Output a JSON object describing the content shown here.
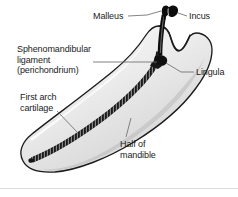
{
  "figure": {
    "background_color": "#ffffff",
    "width": 238,
    "height": 197
  },
  "labels": {
    "malleus": "Malleus",
    "incus": "Incus",
    "sphenomandibular": "Sphenomandibular\nligament\n(perichondrium)",
    "lingula": "Lingula",
    "first_arch_cartilage": "First arch\ncartilage",
    "half_of_mandible": "Half of\nmandible"
  },
  "colors": {
    "outline": "#1b1b1b",
    "text": "#1b1b1b",
    "leader_line": "#6e6e6e",
    "bone_light": "#fbfbfb",
    "bone_mid": "#e3e3e3",
    "bone_dark": "#c4c4c4",
    "cartilage": "#141414",
    "ossicle": "#0d0d0d",
    "divider": "#d9dcdf"
  },
  "structures": {
    "mandible": "half-of-mandible-body",
    "condyle": "condylar-process",
    "coronoid": "coronoid-process",
    "cartilage_strip": "meckels-cartilage-beaded-strip",
    "ligament_strip": "sphenomandibular-ligament-strip",
    "lingula_nub": "lingula-prominence",
    "ossicles": "malleus-and-incus"
  }
}
